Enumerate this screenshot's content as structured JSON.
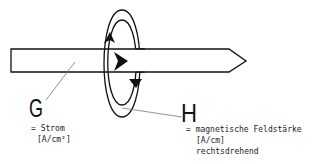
{
  "diagram": {
    "type": "physics-illustration",
    "colors": {
      "stroke": "#111111",
      "leader": "#777777",
      "background": "#ffffff"
    },
    "current": {
      "symbol": "G",
      "description": "= Strom",
      "unit": "[A/cm²]"
    },
    "field": {
      "symbol": "H",
      "description": "= magnetische Feldstärke",
      "unit": "[A/cm]",
      "note": "rechtsdrehend"
    }
  }
}
